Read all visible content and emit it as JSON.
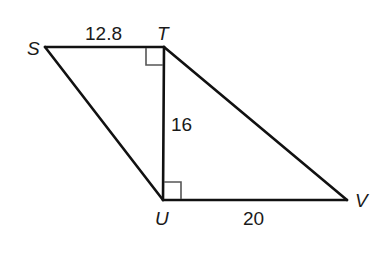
{
  "figure": {
    "type": "geometry-diagram",
    "vertices": [
      {
        "name": "S",
        "x": 45,
        "y": 47
      },
      {
        "name": "T",
        "x": 164,
        "y": 47
      },
      {
        "name": "U",
        "x": 163,
        "y": 200
      },
      {
        "name": "V",
        "x": 347,
        "y": 200
      }
    ],
    "segments": [
      {
        "from": "S",
        "to": "T",
        "label": "12.8"
      },
      {
        "from": "T",
        "to": "U",
        "label": "16"
      },
      {
        "from": "U",
        "to": "V",
        "label": "20"
      },
      {
        "from": "S",
        "to": "U",
        "label": ""
      },
      {
        "from": "T",
        "to": "V",
        "label": ""
      }
    ],
    "right_angles": [
      {
        "vertex": "T",
        "between": [
          "S",
          "U"
        ]
      },
      {
        "vertex": "U",
        "between": [
          "T",
          "V"
        ]
      }
    ],
    "labels": {
      "S": "S",
      "T": "T",
      "U": "U",
      "V": "V",
      "ST": "12.8",
      "TU": "16",
      "UV": "20"
    },
    "colors": {
      "line": "#111111",
      "right_angle_marker": "#555555",
      "background": "#ffffff"
    }
  }
}
